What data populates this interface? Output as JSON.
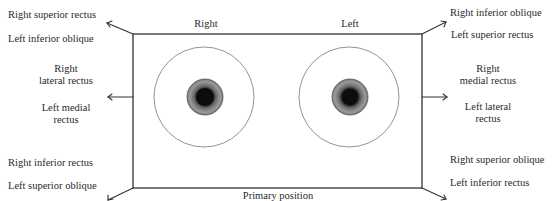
{
  "diagram": {
    "top_labels": {
      "right_eye": "Right",
      "left_eye": "Left"
    },
    "bottom_label": "Primary position",
    "corners": {
      "top_left": {
        "line1": "Right superior rectus",
        "line2": "Left inferior oblique"
      },
      "top_right": {
        "line1": "Right inferior oblique",
        "line2": "Left superior rectus"
      },
      "bottom_left": {
        "line1": "Right inferior rectus",
        "line2": "Left superior oblique"
      },
      "bottom_right": {
        "line1": "Right superior oblique",
        "line2": "Left inferior rectus"
      }
    },
    "sides": {
      "left": {
        "a1": "Right",
        "a2": "lateral rectus",
        "b1": "Left medial",
        "b2": "rectus"
      },
      "right": {
        "a1": "Right",
        "a2": "medial rectus",
        "b1": "Left lateral",
        "b2": "rectus"
      }
    },
    "icons": {
      "eyes": "eye-icon",
      "arrows": "arrow-icon"
    }
  }
}
